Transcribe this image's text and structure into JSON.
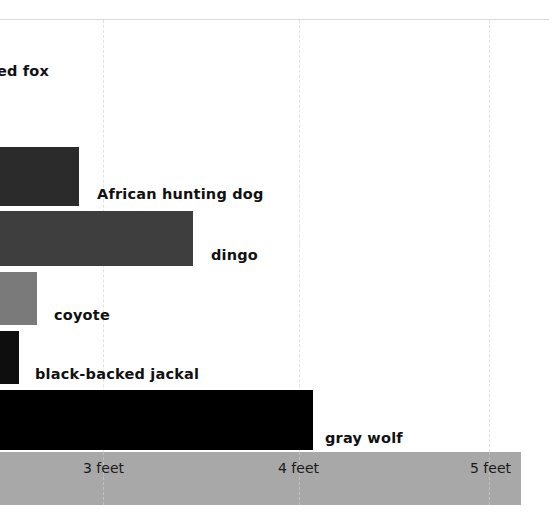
{
  "chart_data": {
    "type": "bar",
    "orientation": "horizontal",
    "title": "",
    "subtitle": "",
    "xlabel": "",
    "ylabel": "",
    "categories": [
      "red fox",
      "African hunting dog",
      "dingo",
      "coyote",
      "black-backed jackal",
      "gray wolf"
    ],
    "values": [
      null,
      2.88,
      3.46,
      2.66,
      2.57,
      4.07
    ],
    "value_unit": "feet",
    "xlim": [
      2.47,
      5.2
    ],
    "x_ticks": [
      3,
      4,
      5
    ],
    "x_tick_labels": [
      "3 feet",
      "4 feet",
      "5 feet"
    ],
    "grid": true,
    "grid_axis": "x",
    "legend": "none",
    "note": "Cropped view of a horizontal bar chart; bars originate left of the visible crop edge and the red fox bar is entirely off-view.",
    "bars": [
      {
        "category": "red fox",
        "label": "ed fox",
        "value": null,
        "color": "#ffffff",
        "bar_visible": false,
        "bar_top": 0,
        "bar_height": 0,
        "bar_right": 0,
        "label_left": -3,
        "label_top": 44
      },
      {
        "category": "African hunting dog",
        "label": "African hunting dog",
        "value": 2.88,
        "color": "#2b2b2b",
        "bar_visible": true,
        "bar_top": 127,
        "bar_height": 59,
        "bar_right": 79,
        "label_left": 97,
        "label_top": 167
      },
      {
        "category": "dingo",
        "label": "dingo",
        "value": 3.46,
        "color": "#3e3e3e",
        "bar_visible": true,
        "bar_top": 191,
        "bar_height": 55,
        "bar_right": 193,
        "label_left": 211,
        "label_top": 228
      },
      {
        "category": "coyote",
        "label": "coyote",
        "value": 2.66,
        "color": "#7a7a7a",
        "bar_visible": true,
        "bar_top": 252,
        "bar_height": 53,
        "bar_right": 37,
        "label_left": 54,
        "label_top": 288
      },
      {
        "category": "black-backed jackal",
        "label": "black-backed jackal",
        "value": 2.57,
        "color": "#0e0e0e",
        "bar_visible": true,
        "bar_top": 311,
        "bar_height": 53,
        "bar_right": 19,
        "label_left": 35,
        "label_top": 347
      },
      {
        "category": "gray wolf",
        "label": "gray wolf",
        "value": 4.07,
        "color": "#000000",
        "bar_visible": true,
        "bar_top": 370,
        "bar_height": 60,
        "bar_right": 313,
        "label_left": 325,
        "label_top": 411
      }
    ],
    "gridlines": [
      {
        "label": "3 feet",
        "x": 103
      },
      {
        "label": "4 feet",
        "x": 299
      },
      {
        "label": "5 feet",
        "x": 489
      }
    ],
    "tick_text_left": [
      83,
      278,
      470
    ]
  },
  "colors": {
    "background": "#ffffff",
    "axis_band": "#a8a8a8",
    "gridline": "#e2e2e2",
    "axis_gridline": "#c0c0c0",
    "top_rule": "#d9d9d9",
    "label_text": "#111111",
    "tick_text": "#1a1a1a"
  }
}
